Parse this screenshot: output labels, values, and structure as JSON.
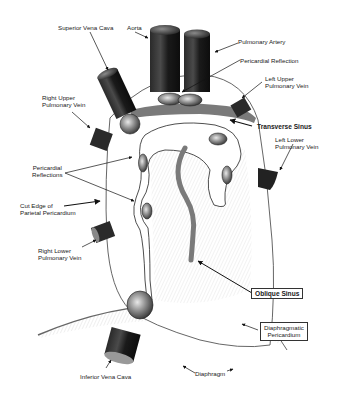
{
  "diagram": {
    "labels": {
      "superior_vena_cava": "Superior Vena Cava",
      "aorta": "Aorta",
      "pulmonary_artery": "Pulmonary Artery",
      "pericardial_reflection": "Pericardial Reflection",
      "left_upper_pulmonary_vein": [
        "Left Upper",
        "Pulmonary Vein"
      ],
      "right_upper_pulmonary_vein": [
        "Right Upper",
        "Pulmonary Vein"
      ],
      "transverse_sinus": "Transverse Sinus",
      "left_lower_pulmonary_vein": [
        "Left Lower",
        "Pulmonary Vein"
      ],
      "pericardial_reflections": [
        "Pericardial",
        "Reflections"
      ],
      "cut_edge_parietal_pericardium": [
        "Cut Edge of",
        "Parietal Pericardium"
      ],
      "right_lower_pulmonary_vein": [
        "Right Lower",
        "Pulmonary Vein"
      ],
      "oblique_sinus": "Oblique Sinus",
      "diaphragmatic_pericardium": [
        "Diaphragmatic",
        "Pericardium"
      ],
      "inferior_vena_cava": "Inferior Vena Cava",
      "diaphragm": "Diaphragm"
    },
    "colors": {
      "vessel_dark": "#1f1f1f",
      "vessel_mid": "#555555",
      "sinus_band": "#7a7a7a",
      "outline": "#333333",
      "hatch": "#bdbdbd",
      "background": "#ffffff"
    }
  }
}
